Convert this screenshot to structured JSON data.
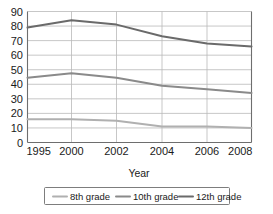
{
  "chart_data": {
    "type": "line",
    "title": "",
    "xlabel": "Year",
    "ylabel": "",
    "x": [
      1995,
      2000,
      2002,
      2004,
      2006,
      2008
    ],
    "categories": [
      "1995",
      "2000",
      "2002",
      "2004",
      "2006",
      "2008"
    ],
    "xtick_labels": [
      "1995",
      "2000",
      "2002",
      "2004",
      "2006",
      "2008"
    ],
    "ytick_labels": [
      "0",
      "10",
      "20",
      "30",
      "40",
      "50",
      "60",
      "70",
      "80",
      "90"
    ],
    "yticks": [
      0,
      10,
      20,
      30,
      40,
      50,
      60,
      70,
      80,
      90
    ],
    "ylim": [
      0,
      90
    ],
    "xlim": [
      1995,
      2008
    ],
    "grid": true,
    "legend_position": "bottom",
    "series": [
      {
        "name": "8th grade",
        "color": "#b0b0b0",
        "values": [
          16,
          16,
          15,
          11,
          11,
          10
        ]
      },
      {
        "name": "10th grade",
        "color": "#8a8a8a",
        "values": [
          44.5,
          47.5,
          44.5,
          39,
          36.5,
          34
        ]
      },
      {
        "name": "12th grade",
        "color": "#6a6a6a",
        "values": [
          79,
          84,
          81,
          73,
          68,
          66
        ]
      }
    ]
  },
  "axis": {
    "x_title": "Year"
  },
  "legend": {
    "entries": [
      {
        "label": "8th grade",
        "color": "#b0b0b0"
      },
      {
        "label": "10th grade",
        "color": "#8a8a8a"
      },
      {
        "label": "12th grade",
        "color": "#6a6a6a"
      }
    ]
  }
}
